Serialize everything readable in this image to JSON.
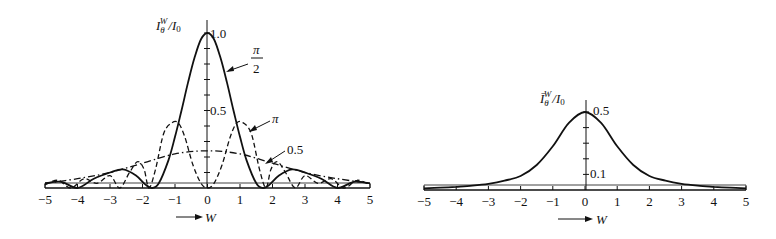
{
  "chart_data": [
    {
      "type": "line",
      "title": "",
      "xlabel": "W",
      "ylabel": "I_θ^W / I_0",
      "xlim": [
        -5,
        5
      ],
      "ylim": [
        0,
        1.0
      ],
      "x_ticks": [
        -5,
        -4,
        -3,
        -2,
        -1,
        0,
        1,
        2,
        3,
        4,
        5
      ],
      "y_tick_labels": [
        {
          "value": 1.0,
          "label": "1.0"
        },
        {
          "value": 0.5,
          "label": "0.5"
        }
      ],
      "grid": false,
      "legend": "annotations with arrows",
      "series": [
        {
          "name": "π/2",
          "style": "solid",
          "x": [
            -5,
            -4.5,
            -4,
            -3.5,
            -3,
            -2.6,
            -2.2,
            -1.9,
            -1.7,
            -1.5,
            -1.2,
            -1.0,
            -0.8,
            -0.6,
            -0.4,
            -0.2,
            0,
            0.2,
            0.4,
            0.6,
            0.8,
            1.0,
            1.2,
            1.5,
            1.7,
            1.9,
            2.2,
            2.6,
            3,
            3.5,
            4,
            4.5,
            5
          ],
          "values": [
            0.03,
            0.04,
            0.0,
            0.06,
            0.1,
            0.12,
            0.08,
            0.02,
            0.0,
            0.03,
            0.18,
            0.33,
            0.5,
            0.68,
            0.84,
            0.96,
            1.0,
            0.96,
            0.84,
            0.68,
            0.5,
            0.33,
            0.18,
            0.03,
            0.0,
            0.02,
            0.08,
            0.12,
            0.1,
            0.06,
            0.0,
            0.04,
            0.03
          ]
        },
        {
          "name": "π",
          "style": "dashed",
          "x": [
            -5,
            -4.6,
            -4.2,
            -3.8,
            -3.4,
            -3.0,
            -2.7,
            -2.4,
            -2.15,
            -1.95,
            -1.8,
            -1.6,
            -1.35,
            -1.1,
            -0.9,
            -0.7,
            -0.45,
            -0.2,
            0,
            0.2,
            0.45,
            0.7,
            0.9,
            1.1,
            1.35,
            1.6,
            1.8,
            1.95,
            2.15,
            2.4,
            2.7,
            3.0,
            3.4,
            3.8,
            4.2,
            4.6,
            5
          ],
          "values": [
            0.02,
            0.05,
            0.0,
            0.06,
            0.03,
            0.08,
            0.0,
            0.1,
            0.17,
            0.12,
            0.0,
            0.12,
            0.35,
            0.42,
            0.42,
            0.33,
            0.15,
            0.03,
            0.0,
            0.03,
            0.15,
            0.33,
            0.42,
            0.42,
            0.35,
            0.12,
            0.0,
            0.12,
            0.17,
            0.1,
            0.0,
            0.08,
            0.03,
            0.06,
            0.0,
            0.05,
            0.02
          ]
        },
        {
          "name": "0.5",
          "style": "dash-dot",
          "x": [
            -5,
            -4,
            -3,
            -2,
            -1,
            0,
            1,
            2,
            3,
            4,
            5
          ],
          "values": [
            0.03,
            0.06,
            0.1,
            0.16,
            0.22,
            0.24,
            0.22,
            0.16,
            0.1,
            0.06,
            0.03
          ]
        }
      ],
      "annotations": [
        {
          "text_num": "π",
          "text_den": "2",
          "target_series": "π/2"
        },
        {
          "text": "π",
          "target_series": "π"
        },
        {
          "text": "0.5",
          "target_series": "0.5"
        }
      ]
    },
    {
      "type": "line",
      "title": "",
      "xlabel": "W",
      "ylabel": "Ī_θ^W / I_0",
      "xlim": [
        -5,
        5
      ],
      "ylim": [
        0,
        0.5
      ],
      "x_ticks": [
        -5,
        -4,
        -3,
        -2,
        -1,
        0,
        1,
        2,
        3,
        4,
        5
      ],
      "y_tick_labels": [
        {
          "value": 0.5,
          "label": "0.5"
        },
        {
          "value": 0.1,
          "label": "0.1"
        }
      ],
      "grid": false,
      "series": [
        {
          "name": "average",
          "style": "solid",
          "x": [
            -5,
            -4.5,
            -4,
            -3.5,
            -3,
            -2.5,
            -2,
            -1.5,
            -1,
            -0.5,
            0,
            0.5,
            1,
            1.5,
            2,
            2.5,
            3,
            3.5,
            4,
            4.5,
            5
          ],
          "values": [
            0.01,
            0.015,
            0.02,
            0.028,
            0.04,
            0.06,
            0.09,
            0.16,
            0.28,
            0.43,
            0.5,
            0.43,
            0.28,
            0.16,
            0.09,
            0.06,
            0.04,
            0.028,
            0.02,
            0.015,
            0.01
          ]
        }
      ]
    }
  ],
  "labels": {
    "left_ylabel_main": "I",
    "left_ylabel_sub": "θ",
    "left_ylabel_sup": "W",
    "left_ylabel_tail": "/I",
    "left_ylabel_tail_sub": "0",
    "right_ylabel_main": "Ī",
    "right_ylabel_sub": "θ",
    "right_ylabel_sup": "W",
    "right_ylabel_tail": "/I",
    "right_ylabel_tail_sub": "0",
    "xlabel": "W",
    "ann_pi2_num": "π",
    "ann_pi2_den": "2",
    "ann_pi": "π",
    "ann_half": "0.5",
    "left_y_top": "1.0",
    "left_y_mid": "0.5",
    "right_y_top": "0.5",
    "right_y_low": "0.1"
  }
}
